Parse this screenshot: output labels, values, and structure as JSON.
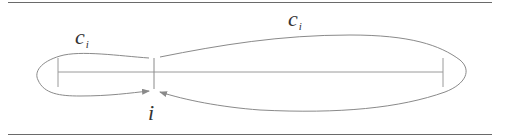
{
  "diagram": {
    "type": "loop-diagram",
    "labels": {
      "left_loop": {
        "base": "c",
        "subscript": "i"
      },
      "right_loop": {
        "base": "c",
        "subscript": "i"
      },
      "vertex": "i"
    },
    "colors": {
      "stroke": "#8a8a8a",
      "rule": "#6a6a6a",
      "text": "#333333",
      "background": "#ffffff"
    }
  }
}
